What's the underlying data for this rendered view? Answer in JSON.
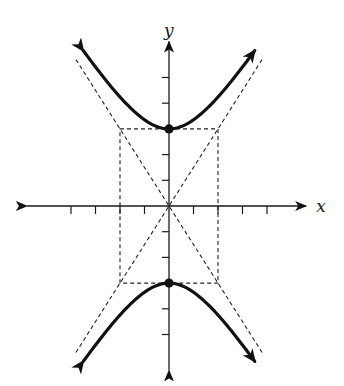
{
  "graph": {
    "axes": {
      "x_label": "x",
      "y_label": "y",
      "x_ticks": [
        -4,
        -3,
        -2,
        -1,
        1,
        2,
        3,
        4
      ],
      "y_ticks": [
        -5,
        -4,
        -3,
        -2,
        -1,
        1,
        2,
        3,
        4,
        5
      ],
      "x_range": [
        -5.8,
        5.6
      ],
      "y_range": [
        -6.4,
        6.4
      ]
    },
    "curve": {
      "kind": "hyperbola",
      "center": [
        0,
        0
      ],
      "orientation": "vertical",
      "a": 3,
      "b": 2,
      "branch_x_extent": 3.5,
      "branches": [
        "upper",
        "lower"
      ]
    },
    "vertices": [
      [
        0,
        3
      ],
      [
        0,
        -3
      ]
    ],
    "fundamental_rectangle": {
      "x": [
        -2,
        2
      ],
      "y": [
        -3,
        3
      ],
      "style": "dashed"
    },
    "asymptotes": {
      "slopes": [
        1.5,
        -1.5
      ],
      "y_extent": 5.7,
      "style": "dashed"
    },
    "colors": {
      "ink": "#111111",
      "background": "#ffffff"
    }
  }
}
